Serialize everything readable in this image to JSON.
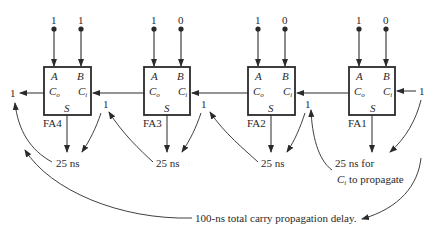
{
  "stroke_color": "#2a2a2a",
  "adders": [
    {
      "name": "FA4",
      "a": "1",
      "b": "1",
      "carry_out": "1",
      "port_a": "A",
      "port_b": "B",
      "port_co": "C",
      "co_sub": "o",
      "port_ci": "C",
      "ci_sub": "i",
      "port_s": "S"
    },
    {
      "name": "FA3",
      "a": "1",
      "b": "0",
      "carry_out": "1",
      "port_a": "A",
      "port_b": "B",
      "port_co": "C",
      "co_sub": "o",
      "port_ci": "C",
      "ci_sub": "i",
      "port_s": "S"
    },
    {
      "name": "FA2",
      "a": "1",
      "b": "0",
      "carry_out": "1",
      "port_a": "A",
      "port_b": "B",
      "port_co": "C",
      "co_sub": "o",
      "port_ci": "C",
      "ci_sub": "i",
      "port_s": "S"
    },
    {
      "name": "FA1",
      "a": "1",
      "b": "0",
      "carry_out": "1",
      "port_a": "A",
      "port_b": "B",
      "port_co": "C",
      "co_sub": "o",
      "port_ci": "C",
      "ci_sub": "i",
      "port_s": "S"
    }
  ],
  "carry_in": "1",
  "delays": {
    "fa4": "25 ns",
    "fa3": "25 ns",
    "fa2": "25 ns",
    "fa1_line1": "25 ns for",
    "fa1_line2_sym": "C",
    "fa1_line2_sub": "i",
    "fa1_line2_rest": " to propagate"
  },
  "total": "100-ns total carry propagation delay."
}
